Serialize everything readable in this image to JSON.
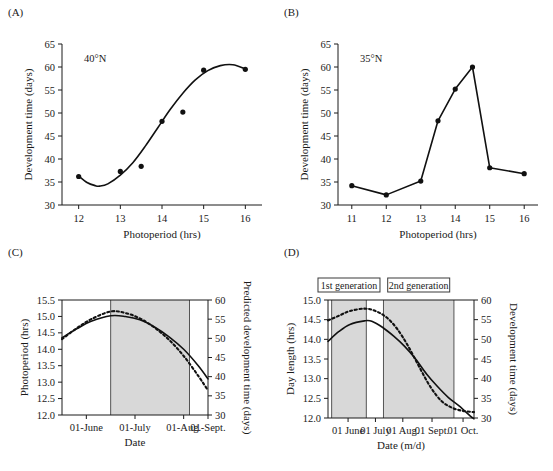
{
  "figure": {
    "background": "#ffffff",
    "line_color": "#111111",
    "band_color": "#d8d8d8"
  },
  "chart_data": [
    {
      "id": "A",
      "panel_letter": "(A)",
      "type": "scatter",
      "title": "",
      "annotation": "40°N",
      "xlabel": "Photoperiod (hrs)",
      "ylabel": "Development time (days)",
      "xlim": [
        11.6,
        16.4
      ],
      "ylim": [
        30,
        65
      ],
      "xticks": [
        12,
        13,
        14,
        15,
        16
      ],
      "xticklabels": [
        "12",
        "13",
        "14",
        "15",
        "16"
      ],
      "yticks": [
        30,
        35,
        40,
        45,
        50,
        55,
        60,
        65
      ],
      "yticklabels": [
        "30",
        "35",
        "40",
        "45",
        "50",
        "55",
        "60",
        "65"
      ],
      "grid": false,
      "legend": "none",
      "x": [
        12.0,
        13.0,
        13.5,
        14.0,
        14.5,
        15.0,
        16.0
      ],
      "values": [
        36.2,
        37.3,
        38.4,
        48.2,
        50.2,
        59.3,
        59.5
      ],
      "fit_curve": {
        "name": "fitted logistic curve",
        "x": [
          12.0,
          12.2,
          12.4,
          12.5,
          12.7,
          13.0,
          13.3,
          13.6,
          13.9,
          14.2,
          14.5,
          14.8,
          15.1,
          15.4,
          15.7,
          16.0
        ],
        "y": [
          36.3,
          34.9,
          34.2,
          34.1,
          34.6,
          36.5,
          39.2,
          42.8,
          46.8,
          50.8,
          54.3,
          57.2,
          59.2,
          60.3,
          60.5,
          59.6
        ]
      }
    },
    {
      "id": "B",
      "panel_letter": "(B)",
      "type": "line",
      "title": "",
      "annotation": "35°N",
      "xlabel": "Photoperiod (hrs)",
      "ylabel": "Development time (days)",
      "xlim": [
        10.6,
        16.4
      ],
      "ylim": [
        30,
        65
      ],
      "xticks": [
        11,
        12,
        13,
        14,
        15,
        16
      ],
      "xticklabels": [
        "11",
        "12",
        "13",
        "14",
        "15",
        "16"
      ],
      "yticks": [
        30,
        35,
        40,
        45,
        50,
        55,
        60,
        65
      ],
      "yticklabels": [
        "30",
        "35",
        "40",
        "45",
        "50",
        "55",
        "60",
        "65"
      ],
      "grid": false,
      "legend": "none",
      "x": [
        11.0,
        12.0,
        13.0,
        13.5,
        14.0,
        14.5,
        15.0,
        16.0
      ],
      "values": [
        34.2,
        32.2,
        35.2,
        48.3,
        55.2,
        60.0,
        38.1,
        36.8
      ],
      "markers": true
    },
    {
      "id": "C",
      "panel_letter": "(C)",
      "type": "line",
      "title": "",
      "xlabel": "Date",
      "ylabel": "Photoperiod (hrs)",
      "ylabel_right": "Predicted development time (days)",
      "ylim": [
        12.0,
        15.5
      ],
      "ylim_right": [
        30,
        60
      ],
      "xticks": [
        "01-June",
        "01-July",
        "01-Aug.",
        "01-Sept."
      ],
      "xticklabels": [
        "01-June",
        "01-July",
        "01-Aug.",
        "01-Sept."
      ],
      "yticks": [
        12.0,
        12.5,
        13.0,
        13.5,
        14.0,
        14.5,
        15.0,
        15.5
      ],
      "yticklabels": [
        "12.0",
        "12.5",
        "13.0",
        "13.5",
        "14.0",
        "14.5",
        "15.0",
        "15.5"
      ],
      "yticks_right": [
        30,
        35,
        40,
        45,
        50,
        55,
        60
      ],
      "yticklabels_right": [
        "30",
        "35",
        "40",
        "45",
        "50",
        "55",
        "60"
      ],
      "grid": false,
      "legend": "none",
      "shaded_bands": [
        {
          "start": 1.0,
          "end": 2.62,
          "label": ""
        }
      ],
      "series": [
        {
          "name": "photoperiod (solid)",
          "style": "solid",
          "axis": "left",
          "x": [
            0.0,
            0.3,
            0.6,
            1.0,
            1.3,
            1.6,
            1.9,
            2.2,
            2.5,
            2.8,
            3.0
          ],
          "values": [
            14.35,
            14.62,
            14.85,
            15.02,
            15.0,
            14.9,
            14.68,
            14.38,
            14.0,
            13.5,
            13.1
          ]
        },
        {
          "name": "predicted development time (dotted)",
          "style": "dotted",
          "axis": "right",
          "x": [
            0.0,
            0.3,
            0.6,
            1.0,
            1.3,
            1.6,
            1.9,
            2.2,
            2.5,
            2.8,
            3.0
          ],
          "values": [
            49.8,
            52.6,
            55.0,
            57.0,
            56.6,
            55.2,
            52.8,
            49.6,
            45.4,
            40.2,
            36.4
          ]
        }
      ]
    },
    {
      "id": "D",
      "panel_letter": "(D)",
      "type": "line",
      "title": "",
      "xlabel": "Date (m/d)",
      "ylabel": "Day length (hrs)",
      "ylabel_right": "Development time (days)",
      "ylim": [
        12.0,
        15.0
      ],
      "ylim_right": [
        30,
        60
      ],
      "xticks": [
        "01 June",
        "01 July",
        "01 Aug.",
        "01 Sept.",
        "01 Oct."
      ],
      "xticklabels": [
        "01 June",
        "01 July",
        "01 Aug.",
        "01 Sept.",
        "01 Oct."
      ],
      "yticks": [
        12.0,
        12.5,
        13.0,
        13.5,
        14.0,
        14.5,
        15.0
      ],
      "yticklabels": [
        "12.0",
        "12.5",
        "13.0",
        "13.5",
        "14.0",
        "14.5",
        "15.0"
      ],
      "yticks_right": [
        30,
        35,
        40,
        45,
        50,
        55,
        60
      ],
      "yticklabels_right": [
        "30",
        "35",
        "40",
        "45",
        "50",
        "55",
        "60"
      ],
      "grid": false,
      "legend": "none",
      "shaded_bands": [
        {
          "start": 0.1,
          "end": 1.05,
          "label": "1st generation"
        },
        {
          "start": 1.52,
          "end": 3.45,
          "label": "2nd generation"
        }
      ],
      "generation_labels": [
        "1st generation",
        "2nd generation"
      ],
      "series": [
        {
          "name": "day length (solid)",
          "style": "solid",
          "axis": "left",
          "x": [
            0.0,
            0.3,
            0.6,
            1.0,
            1.2,
            1.5,
            1.8,
            2.1,
            2.4,
            2.7,
            3.0,
            3.3,
            3.6,
            3.9,
            4.0
          ],
          "values": [
            13.95,
            14.2,
            14.38,
            14.47,
            14.46,
            14.3,
            14.08,
            13.82,
            13.5,
            13.12,
            12.8,
            12.52,
            12.3,
            12.05,
            11.98
          ]
        },
        {
          "name": "development time (dotted)",
          "style": "dotted",
          "axis": "right",
          "x": [
            0.0,
            0.3,
            0.6,
            1.0,
            1.3,
            1.6,
            1.9,
            2.2,
            2.5,
            2.8,
            3.1,
            3.4,
            3.7,
            4.0
          ],
          "values": [
            54.8,
            56.0,
            57.2,
            57.8,
            57.2,
            55.6,
            52.6,
            48.2,
            43.0,
            38.0,
            34.4,
            32.6,
            31.8,
            31.5
          ]
        }
      ]
    }
  ]
}
